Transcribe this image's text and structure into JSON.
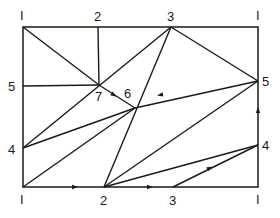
{
  "diagram": {
    "stroke": "#1a1a1a",
    "background": "#ffffff",
    "frame": {
      "x1": 23,
      "y1": 27,
      "x2": 258,
      "y2": 187
    },
    "labels": [
      {
        "id": "tl",
        "text": "I",
        "x": 20,
        "y": 20
      },
      {
        "id": "t2",
        "text": "2",
        "x": 94,
        "y": 21
      },
      {
        "id": "t3",
        "text": "3",
        "x": 167,
        "y": 21
      },
      {
        "id": "tr",
        "text": "I",
        "x": 256,
        "y": 20
      },
      {
        "id": "l5",
        "text": "5",
        "x": 8,
        "y": 91
      },
      {
        "id": "l4",
        "text": "4",
        "x": 8,
        "y": 154
      },
      {
        "id": "r5",
        "text": "5",
        "x": 262,
        "y": 86
      },
      {
        "id": "r4",
        "text": "4",
        "x": 262,
        "y": 150
      },
      {
        "id": "n7",
        "text": "7",
        "x": 95,
        "y": 101
      },
      {
        "id": "n6",
        "text": "6",
        "x": 124,
        "y": 98
      },
      {
        "id": "bl",
        "text": "I",
        "x": 20,
        "y": 204
      },
      {
        "id": "b2",
        "text": "2",
        "x": 100,
        "y": 205
      },
      {
        "id": "b3",
        "text": "3",
        "x": 169,
        "y": 205
      },
      {
        "id": "br",
        "text": "I",
        "x": 256,
        "y": 204
      }
    ],
    "segments": [
      {
        "from": [
          98,
          27
        ],
        "to": [
          99,
          85
        ]
      },
      {
        "from": [
          23,
          86
        ],
        "to": [
          99,
          85
        ]
      },
      {
        "from": [
          23,
          27
        ],
        "to": [
          99,
          85
        ]
      },
      {
        "from": [
          99,
          85
        ],
        "to": [
          135,
          108
        ]
      },
      {
        "from": [
          23,
          148
        ],
        "to": [
          171,
          27
        ]
      },
      {
        "from": [
          171,
          27
        ],
        "to": [
          258,
          81
        ]
      },
      {
        "from": [
          23,
          148
        ],
        "to": [
          135,
          108
        ]
      },
      {
        "from": [
          23,
          187
        ],
        "to": [
          135,
          108
        ]
      },
      {
        "from": [
          135,
          108
        ],
        "to": [
          258,
          81
        ]
      },
      {
        "from": [
          104,
          187
        ],
        "to": [
          171,
          27
        ]
      },
      {
        "from": [
          104,
          187
        ],
        "to": [
          258,
          81
        ]
      },
      {
        "from": [
          104,
          187
        ],
        "to": [
          258,
          145
        ]
      },
      {
        "from": [
          173,
          187
        ],
        "to": [
          258,
          145
        ]
      }
    ],
    "arrows": [
      {
        "x": 114,
        "y": 95,
        "angle": 33
      },
      {
        "x": 160,
        "y": 95,
        "angle": 168
      },
      {
        "x": 75,
        "y": 187,
        "angle": 0
      },
      {
        "x": 150,
        "y": 187,
        "angle": 0
      },
      {
        "x": 258,
        "y": 110,
        "angle": -90
      },
      {
        "x": 210,
        "y": 168,
        "angle": -26
      }
    ]
  }
}
